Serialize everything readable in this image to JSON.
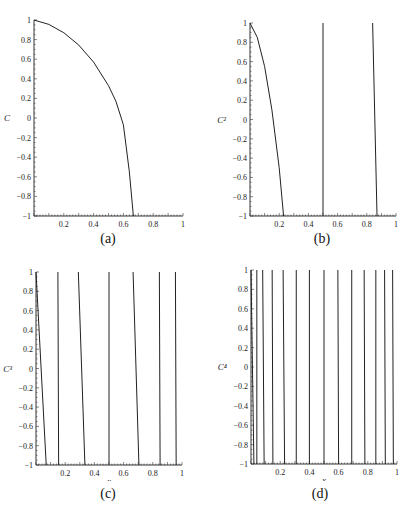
{
  "chart_data": [
    {
      "type": "line",
      "panel": "(a)",
      "ylabel": "C",
      "xlabel": "x",
      "xlim": [
        0,
        1
      ],
      "ylim": [
        -1,
        1
      ],
      "xticks": [
        "0.2",
        "0.4",
        "0.6",
        "0.8",
        "1"
      ],
      "yticks": [
        "1",
        "0.8",
        "0.6",
        "0.4",
        "0.2",
        "0",
        "-0.2",
        "-0.4",
        "-0.6",
        "-0.8",
        "-1"
      ],
      "curves": [
        {
          "points": [
            [
              0,
              1
            ],
            [
              0.1,
              0.955
            ],
            [
              0.2,
              0.87
            ],
            [
              0.3,
              0.745
            ],
            [
              0.4,
              0.57
            ],
            [
              0.5,
              0.33
            ],
            [
              0.55,
              0.17
            ],
            [
              0.6,
              -0.07
            ],
            [
              0.64,
              -0.55
            ],
            [
              0.667,
              -1
            ]
          ]
        }
      ],
      "caption": "(a)"
    },
    {
      "type": "line",
      "panel": "(b)",
      "ylabel": "C²",
      "xlabel": "x",
      "xlim": [
        0,
        1
      ],
      "ylim": [
        -1,
        1
      ],
      "xticks": [
        "0.2",
        "0.4",
        "0.6",
        "0.8",
        "1"
      ],
      "yticks": [
        "1",
        "0.8",
        "0.6",
        "0.4",
        "0.2",
        "0",
        "-0.2",
        "-0.4",
        "-0.6",
        "-0.8",
        "-1"
      ],
      "curves": [
        {
          "points": [
            [
              0,
              1
            ],
            [
              0.05,
              0.85
            ],
            [
              0.1,
              0.55
            ],
            [
              0.15,
              0.1
            ],
            [
              0.2,
              -0.5
            ],
            [
              0.23,
              -1
            ]
          ]
        },
        {
          "points": [
            [
              0.5,
              1
            ],
            [
              0.5,
              -1
            ]
          ]
        },
        {
          "points": [
            [
              0.84,
              1
            ],
            [
              0.87,
              -1
            ]
          ]
        }
      ],
      "caption": "(b)"
    },
    {
      "type": "line",
      "panel": "(c)",
      "ylabel": "C³",
      "xlabel": "x",
      "xlim": [
        0,
        1
      ],
      "ylim": [
        -1,
        1
      ],
      "xticks": [
        "0.2",
        "0.4",
        "0.6",
        "0.8",
        "1"
      ],
      "yticks": [
        "1",
        "0.8",
        "0.6",
        "0.4",
        "0.2",
        "0",
        "-0.2",
        "-0.4",
        "-0.6",
        "-0.8",
        "-1"
      ],
      "curves": [
        {
          "points": [
            [
              0,
              1
            ],
            [
              0.07,
              -1
            ]
          ]
        },
        {
          "points": [
            [
              0.15,
              1
            ],
            [
              0.155,
              -1
            ]
          ]
        },
        {
          "points": [
            [
              0.29,
              1
            ],
            [
              0.335,
              -1
            ]
          ]
        },
        {
          "points": [
            [
              0.5,
              1
            ],
            [
              0.5,
              -1
            ]
          ]
        },
        {
          "points": [
            [
              0.665,
              1
            ],
            [
              0.705,
              -1
            ]
          ]
        },
        {
          "points": [
            [
              0.845,
              1
            ],
            [
              0.85,
              -1
            ]
          ]
        },
        {
          "points": [
            [
              0.955,
              1
            ],
            [
              0.96,
              -1
            ]
          ]
        }
      ],
      "caption": "(c)"
    },
    {
      "type": "line",
      "panel": "(d)",
      "ylabel": "C⁴",
      "xlabel": "x",
      "xlim": [
        0,
        1
      ],
      "ylim": [
        -1,
        1
      ],
      "xticks": [
        "0.2",
        "0.4",
        "0.6",
        "0.8",
        "1"
      ],
      "yticks": [
        "1",
        "0.8",
        "0.6",
        "0.4",
        "0.2",
        "0",
        "-0.2",
        "-0.4",
        "-0.6",
        "-0.8",
        "-1"
      ],
      "curves": [
        {
          "points": [
            [
              0.0,
              1
            ],
            [
              0.02,
              -1
            ]
          ]
        },
        {
          "points": [
            [
              0.04,
              1
            ],
            [
              0.04,
              -1
            ]
          ]
        },
        {
          "points": [
            [
              0.08,
              1
            ],
            [
              0.09,
              -1
            ]
          ]
        },
        {
          "points": [
            [
              0.145,
              1
            ],
            [
              0.15,
              -1
            ]
          ]
        },
        {
          "points": [
            [
              0.22,
              1
            ],
            [
              0.23,
              -1
            ]
          ]
        },
        {
          "points": [
            [
              0.31,
              1
            ],
            [
              0.31,
              -1
            ]
          ]
        },
        {
          "points": [
            [
              0.4,
              1
            ],
            [
              0.4,
              -1
            ]
          ]
        },
        {
          "points": [
            [
              0.5,
              1
            ],
            [
              0.5,
              -1
            ]
          ]
        },
        {
          "points": [
            [
              0.595,
              1
            ],
            [
              0.6,
              -1
            ]
          ]
        },
        {
          "points": [
            [
              0.69,
              1
            ],
            [
              0.69,
              -1
            ]
          ]
        },
        {
          "points": [
            [
              0.775,
              1
            ],
            [
              0.78,
              -1
            ]
          ]
        },
        {
          "points": [
            [
              0.855,
              1
            ],
            [
              0.855,
              -1
            ]
          ]
        },
        {
          "points": [
            [
              0.915,
              1
            ],
            [
              0.92,
              -1
            ]
          ]
        },
        {
          "points": [
            [
              0.97,
              1
            ],
            [
              0.975,
              -1
            ]
          ]
        }
      ],
      "caption": "(d)"
    }
  ]
}
